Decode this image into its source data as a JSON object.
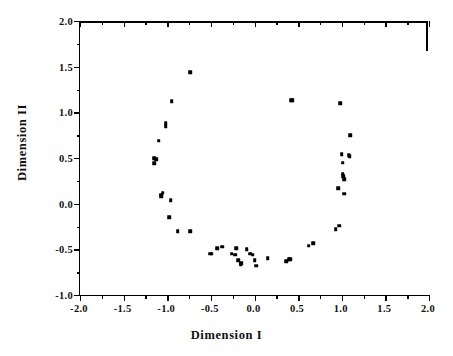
{
  "chart_data": {
    "type": "scatter",
    "title": "",
    "xlabel": "Dimension  I",
    "ylabel": "Dimension  II",
    "xlim": [
      -2.0,
      2.0
    ],
    "ylim": [
      -1.0,
      2.0
    ],
    "xticks": [
      -2.0,
      -1.5,
      -1.0,
      -0.5,
      0.0,
      0.5,
      1.0,
      1.5,
      2.0
    ],
    "xticklabels": [
      "-2.0",
      "-1.5",
      "-1.0",
      "-0.5",
      "0.0",
      "0.5",
      "1.0",
      "1.5",
      "2.0"
    ],
    "yticks": [
      -1.0,
      -0.5,
      0.0,
      0.5,
      1.0,
      1.5,
      2.0
    ],
    "yticklabels": [
      "-1.0",
      "-0.5",
      "0.0",
      "0.5",
      "1.0",
      "1.5",
      "2.0"
    ],
    "minor_ticks": true,
    "grid": false,
    "legend": null,
    "marker": "square",
    "marker_color": "#000000",
    "marker_size": 3.6,
    "points": [
      [
        -0.74,
        1.44
      ],
      [
        -0.95,
        1.12
      ],
      [
        -1.02,
        0.88
      ],
      [
        -1.02,
        0.85
      ],
      [
        -1.1,
        0.69
      ],
      [
        -1.15,
        0.5
      ],
      [
        -1.13,
        0.49
      ],
      [
        -1.15,
        0.44
      ],
      [
        -1.05,
        0.12
      ],
      [
        -1.07,
        0.1
      ],
      [
        -1.07,
        0.08
      ],
      [
        -0.96,
        0.04
      ],
      [
        -0.98,
        -0.15
      ],
      [
        -0.88,
        -0.3
      ],
      [
        -0.74,
        -0.3
      ],
      [
        -0.51,
        -0.55
      ],
      [
        -0.49,
        -0.55
      ],
      [
        -0.43,
        -0.49
      ],
      [
        -0.37,
        -0.47
      ],
      [
        -0.26,
        -0.55
      ],
      [
        -0.22,
        -0.56
      ],
      [
        -0.21,
        -0.49
      ],
      [
        -0.19,
        -0.62
      ],
      [
        -0.16,
        -0.66
      ],
      [
        -0.15,
        -0.65
      ],
      [
        -0.09,
        -0.5
      ],
      [
        -0.05,
        -0.55
      ],
      [
        -0.02,
        -0.56
      ],
      [
        0.0,
        -0.62
      ],
      [
        0.02,
        -0.68
      ],
      [
        0.15,
        -0.6
      ],
      [
        0.36,
        -0.63
      ],
      [
        0.39,
        -0.61
      ],
      [
        0.41,
        -0.61
      ],
      [
        0.42,
        1.13
      ],
      [
        0.43,
        1.13
      ],
      [
        0.62,
        -0.46
      ],
      [
        0.67,
        -0.43
      ],
      [
        0.93,
        -0.28
      ],
      [
        0.97,
        -0.24
      ],
      [
        0.98,
        1.1
      ],
      [
        0.96,
        0.17
      ],
      [
        1.03,
        0.11
      ],
      [
        1.01,
        0.33
      ],
      [
        1.02,
        0.3
      ],
      [
        1.03,
        0.27
      ],
      [
        1.01,
        0.45
      ],
      [
        1.0,
        0.54
      ],
      [
        1.08,
        0.53
      ],
      [
        1.09,
        0.52
      ],
      [
        1.1,
        0.75
      ]
    ]
  },
  "axes": {
    "x_title": "Dimension  I",
    "y_title": "Dimension  II"
  }
}
